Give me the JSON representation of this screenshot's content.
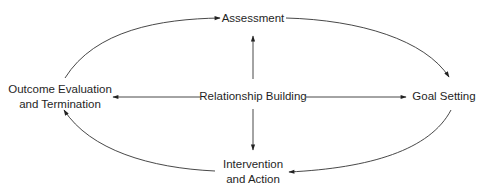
{
  "diagram": {
    "type": "cycle-with-hub",
    "hub": {
      "id": "relationship",
      "lines": [
        "Relationship Building"
      ]
    },
    "nodes": [
      {
        "id": "assessment",
        "lines": [
          "Assessment"
        ]
      },
      {
        "id": "goal",
        "lines": [
          "Goal Setting"
        ]
      },
      {
        "id": "intervention",
        "lines": [
          "Intervention",
          "and Action"
        ]
      },
      {
        "id": "outcome",
        "lines": [
          "Outcome Evaluation",
          "and Termination"
        ]
      }
    ],
    "edges": [
      {
        "from": "relationship",
        "to": "assessment",
        "style": "straight"
      },
      {
        "from": "relationship",
        "to": "goal",
        "style": "straight"
      },
      {
        "from": "relationship",
        "to": "intervention",
        "style": "straight"
      },
      {
        "from": "relationship",
        "to": "outcome",
        "style": "straight"
      },
      {
        "from": "assessment",
        "to": "goal",
        "style": "curved"
      },
      {
        "from": "goal",
        "to": "intervention",
        "style": "curved"
      },
      {
        "from": "intervention",
        "to": "outcome",
        "style": "curved"
      },
      {
        "from": "outcome",
        "to": "assessment",
        "style": "curved"
      }
    ],
    "colors": {
      "line": "#333333",
      "text": "#1f1f1f",
      "background": "#ffffff"
    }
  }
}
